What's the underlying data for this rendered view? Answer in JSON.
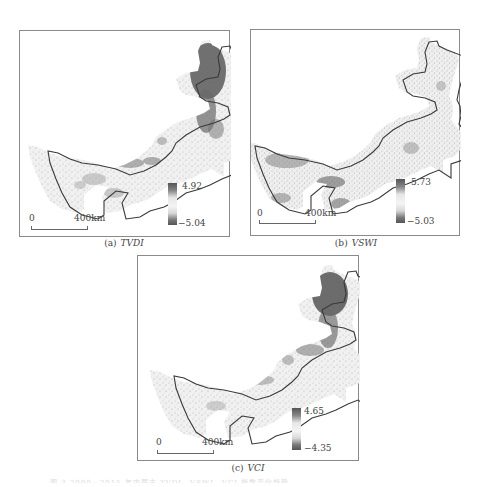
{
  "figure": {
    "panels": [
      {
        "id": "a",
        "label": "(a)",
        "variable": "TVDI",
        "legend": {
          "max": "4.92",
          "min": "−5.04"
        },
        "scale": {
          "zero": "0",
          "distance": "400km"
        },
        "pattern": "northeast-dark"
      },
      {
        "id": "b",
        "label": "(b)",
        "variable": "VSWI",
        "legend": {
          "max": "5.73",
          "min": "−5.03"
        },
        "scale": {
          "zero": "0",
          "distance": "400km"
        },
        "pattern": "west-dark"
      },
      {
        "id": "c",
        "label": "(c)",
        "variable": "VCI",
        "legend": {
          "max": "4.65",
          "min": "−4.35"
        },
        "scale": {
          "zero": "0",
          "distance": "400km"
        },
        "pattern": "northeast-dark"
      }
    ],
    "footer_caption": "图 3  2000—2015 年内蒙古 TVDI、VSWI、VCI 指数变化趋势"
  },
  "colors": {
    "frame": "#8a8a8a",
    "outline": "#3a3a3a",
    "fill_light": "#f1f1f1",
    "fill_dark": "#5a5a5a",
    "legend_dark": "#555555",
    "legend_light": "#f0f0f0"
  }
}
